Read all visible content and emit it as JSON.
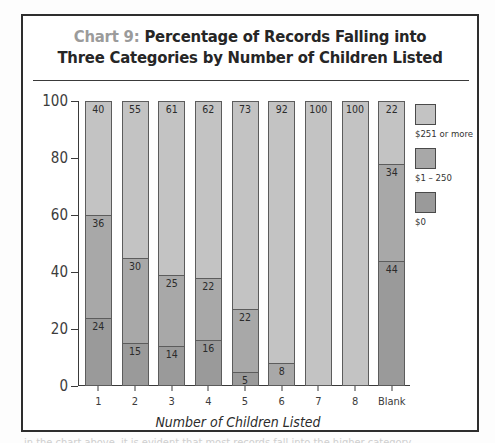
{
  "title": {
    "prefix": "Chart 9:",
    "line1_rest": " Percentage of Records Falling into",
    "line2": "Three Categories by Number of Children Listed"
  },
  "legend": {
    "items": [
      {
        "label": "$251 or more",
        "color": "#c3c3c3",
        "key": "high"
      },
      {
        "label": "$1 – 250",
        "color": "#a8a8a8",
        "key": "mid"
      },
      {
        "label": "$0",
        "color": "#9a9a9a",
        "key": "low"
      }
    ]
  },
  "chart_data": {
    "type": "bar",
    "subtype": "stacked-column-100",
    "title": "Chart 9: Percentage of Records Falling into Three Categories by Number of Children Listed",
    "xlabel": "Number of Children Listed",
    "ylabel": "",
    "ylim": [
      0,
      100
    ],
    "yticks": [
      0,
      20,
      40,
      60,
      80,
      100
    ],
    "grid": false,
    "legend_position": "right",
    "categories": [
      "1",
      "2",
      "3",
      "4",
      "5",
      "6",
      "7",
      "8",
      "Blank"
    ],
    "series": [
      {
        "name": "$0",
        "values": [
          24,
          15,
          14,
          16,
          5,
          0,
          0,
          0,
          44
        ]
      },
      {
        "name": "$1 – 250",
        "values": [
          36,
          30,
          25,
          22,
          22,
          8,
          0,
          0,
          34
        ]
      },
      {
        "name": "$251 or more",
        "values": [
          40,
          55,
          61,
          62,
          73,
          92,
          100,
          100,
          22
        ]
      }
    ],
    "bars": [
      {
        "category": "1",
        "low": 24,
        "mid": 36,
        "high": 40
      },
      {
        "category": "2",
        "low": 15,
        "mid": 30,
        "high": 55
      },
      {
        "category": "3",
        "low": 14,
        "mid": 25,
        "high": 61
      },
      {
        "category": "4",
        "low": 16,
        "mid": 22,
        "high": 62
      },
      {
        "category": "5",
        "low": 5,
        "mid": 22,
        "high": 73
      },
      {
        "category": "6",
        "low": 0,
        "mid": 8,
        "high": 92
      },
      {
        "category": "7",
        "low": 0,
        "mid": 0,
        "high": 100
      },
      {
        "category": "8",
        "low": 0,
        "mid": 0,
        "high": 100
      },
      {
        "category": "Blank",
        "low": 44,
        "mid": 34,
        "high": 22
      }
    ]
  },
  "caption_clipped": "in the chart above, it is evident that most records fall into the higher category"
}
